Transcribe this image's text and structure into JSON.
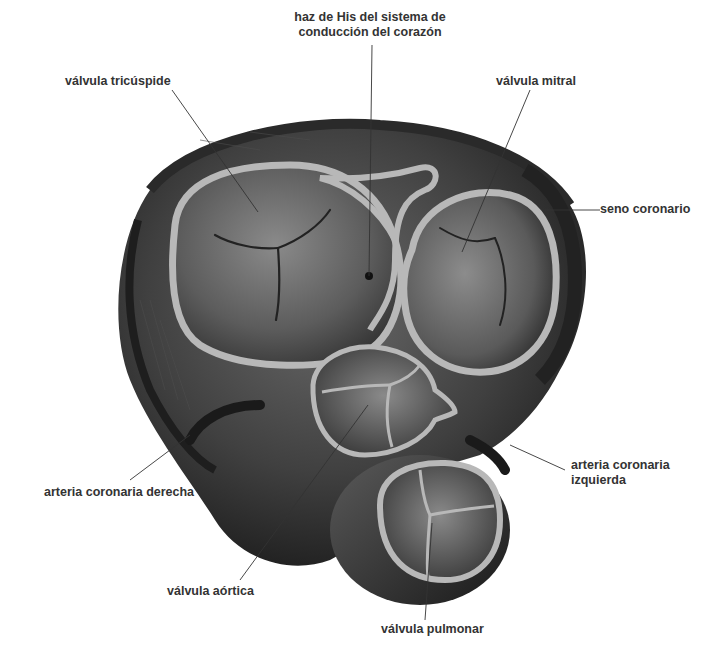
{
  "diagram": {
    "colors": {
      "background": "#ffffff",
      "label_text": "#333333",
      "tissue_dark": "#2a2a2a",
      "tissue_mid": "#5a5a5a",
      "annulus_ring": "#b8b8b8",
      "leader_line": "#333333"
    },
    "labels": {
      "his_bundle_line1": "haz de His del sistema de",
      "his_bundle_line2": "conducción del corazón",
      "tricuspid": "válvula tricúspide",
      "mitral": "válvula mitral",
      "coronary_sinus": "seno coronario",
      "left_coronary_line1": "arteria coronaria",
      "left_coronary_line2": "izquierda",
      "right_coronary": "arteria coronaria derecha",
      "aortic": "válvula aórtica",
      "pulmonary": "válvula pulmonar"
    }
  }
}
